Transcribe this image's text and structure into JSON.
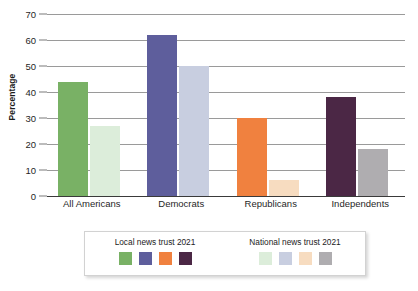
{
  "chart_data": {
    "type": "bar",
    "title": "",
    "xlabel": "",
    "ylabel": "Percentage",
    "ylim": [
      0,
      70
    ],
    "ytick_step": 10,
    "yticks": [
      0,
      10,
      20,
      30,
      40,
      50,
      60,
      70
    ],
    "grid": true,
    "categories": [
      "All Americans",
      "Democrats",
      "Republicans",
      "Independents"
    ],
    "series": [
      {
        "name": "Local news trust 2021",
        "values": [
          44,
          62,
          30,
          38
        ],
        "colors": [
          "#79B165",
          "#5E5E9C",
          "#F0813F",
          "#4B2745"
        ]
      },
      {
        "name": "National news trust 2021",
        "values": [
          27,
          50,
          6,
          18
        ],
        "colors": [
          "#DCEDDA",
          "#C8CEE0",
          "#F7DCC0",
          "#AFADB0"
        ]
      }
    ],
    "legend_position": "bottom"
  },
  "axis": {
    "y_title": "Percentage",
    "y_tick_labels": [
      "70",
      "60",
      "50",
      "40",
      "30",
      "20",
      "10",
      "0"
    ],
    "x_tick_labels": [
      "All Americans",
      "Democrats",
      "Republicans",
      "Independents"
    ]
  },
  "legend": {
    "groups": [
      {
        "title": "Local news trust 2021"
      },
      {
        "title": "National news trust 2021"
      }
    ]
  }
}
